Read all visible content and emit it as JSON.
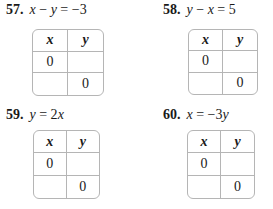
{
  "problems": [
    {
      "number": "57.",
      "equation_parts": [
        "x",
        " − ",
        "y",
        " = −3"
      ],
      "table": {
        "headers": [
          "x",
          "y"
        ],
        "rows": [
          [
            "0",
            ""
          ],
          [
            "",
            "0"
          ]
        ]
      }
    },
    {
      "number": "58.",
      "equation_parts": [
        "y",
        " − ",
        "x",
        " = 5"
      ],
      "table": {
        "headers": [
          "x",
          "y"
        ],
        "rows": [
          [
            "0",
            ""
          ],
          [
            "",
            "0"
          ]
        ]
      }
    },
    {
      "number": "59.",
      "equation_parts": [
        "y",
        " = 2",
        "x",
        ""
      ],
      "table": {
        "headers": [
          "x",
          "y"
        ],
        "rows": [
          [
            "0",
            ""
          ],
          [
            "",
            "0"
          ]
        ]
      }
    },
    {
      "number": "60.",
      "equation_parts": [
        "x",
        " = −3",
        "y",
        ""
      ],
      "table": {
        "headers": [
          "x",
          "y"
        ],
        "rows": [
          [
            "0",
            ""
          ],
          [
            "",
            "0"
          ]
        ]
      }
    }
  ]
}
